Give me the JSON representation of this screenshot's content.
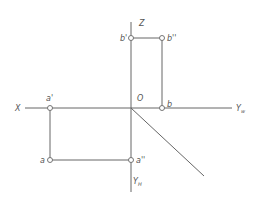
{
  "diagram": {
    "type": "orthographic-projection",
    "axes": {
      "X": {
        "label": "X"
      },
      "Z": {
        "label": "Z"
      },
      "origin": {
        "label": "O"
      },
      "Yw": {
        "label": "Y",
        "sub": "w"
      },
      "Yh": {
        "label": "Y",
        "sub": "H"
      }
    },
    "points": [
      {
        "id": "a_prime",
        "label": "a'",
        "x": 50,
        "y": 108
      },
      {
        "id": "a",
        "label": "a",
        "x": 50,
        "y": 160
      },
      {
        "id": "a_dprime",
        "label": "a''",
        "x": 131,
        "y": 160
      },
      {
        "id": "b_prime",
        "label": "b'",
        "x": 131,
        "y": 38
      },
      {
        "id": "b_dprime",
        "label": "b''",
        "x": 162,
        "y": 38
      },
      {
        "id": "b",
        "label": "b",
        "x": 162,
        "y": 108
      }
    ],
    "colors": {
      "line": "#666666",
      "text": "#555555",
      "background": "#ffffff"
    }
  }
}
